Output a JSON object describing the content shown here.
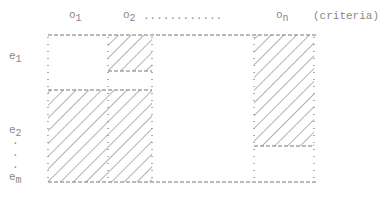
{
  "diagram": {
    "column_labels": [
      {
        "base": "o",
        "sub": "1"
      },
      {
        "base": "o",
        "sub": "2"
      },
      {
        "base": "o",
        "sub": "n"
      }
    ],
    "column_ellipsis": "............",
    "criteria_label": "(criteria)",
    "row_labels": [
      {
        "base": "e",
        "sub": "1"
      },
      {
        "base": "e",
        "sub": "2"
      },
      {
        "base": "e",
        "sub": "m"
      }
    ],
    "row_ellipsis": [
      "·",
      "·",
      "·"
    ],
    "colors": {
      "line": "#777777",
      "hatch": "#666666",
      "text": "#888888"
    }
  }
}
